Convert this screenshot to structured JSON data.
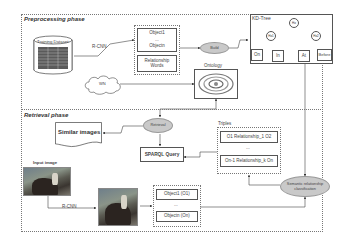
{
  "preprocessing": {
    "title": "Preprocessing phase",
    "training_dataset": "Training Dataset",
    "rcnn_label": "R-CNN",
    "object_first": "Object1",
    "object_ellipsis": "...",
    "object_last": "Objectn",
    "relationship_words": "Relationship Words",
    "build_label": "Build",
    "wordnet_label": "WN",
    "ontology_title": "Ontology",
    "kdtree": {
      "title": "KD-Tree",
      "root": "Ho",
      "left": "Ho1",
      "right": "Ho2",
      "leaves": [
        "On",
        "In",
        "At",
        "Before"
      ]
    }
  },
  "retrieval": {
    "title": "Retrieval phase",
    "retrieval_label": "Retrieval",
    "similar_images": "Similar images",
    "sparql_query": "SPARQL Query",
    "triples_title": "Triples",
    "triple_first": "O1 Relationship_1 O2",
    "triple_ellipsis": "...",
    "triple_last": "On-1 Relationship_k On",
    "semantic_classification": "Semantic relationship classification",
    "input_image_label": "Input image",
    "rcnn_label": "R-CNN",
    "detected_first": "Object1 (O1)",
    "detected_ellipsis": "...",
    "detected_last": "Objectn (On)"
  }
}
